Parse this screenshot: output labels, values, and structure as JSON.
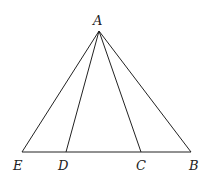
{
  "diagram": {
    "points": {
      "A": {
        "label": "A",
        "x": 99,
        "y": 31
      },
      "E": {
        "label": "E",
        "x": 22,
        "y": 152
      },
      "D": {
        "label": "D",
        "x": 66,
        "y": 152
      },
      "C": {
        "label": "C",
        "x": 141,
        "y": 152
      },
      "B": {
        "label": "B",
        "x": 191,
        "y": 152
      }
    },
    "segments": [
      [
        "A",
        "E"
      ],
      [
        "A",
        "D"
      ],
      [
        "A",
        "C"
      ],
      [
        "A",
        "B"
      ],
      [
        "E",
        "B"
      ]
    ]
  }
}
